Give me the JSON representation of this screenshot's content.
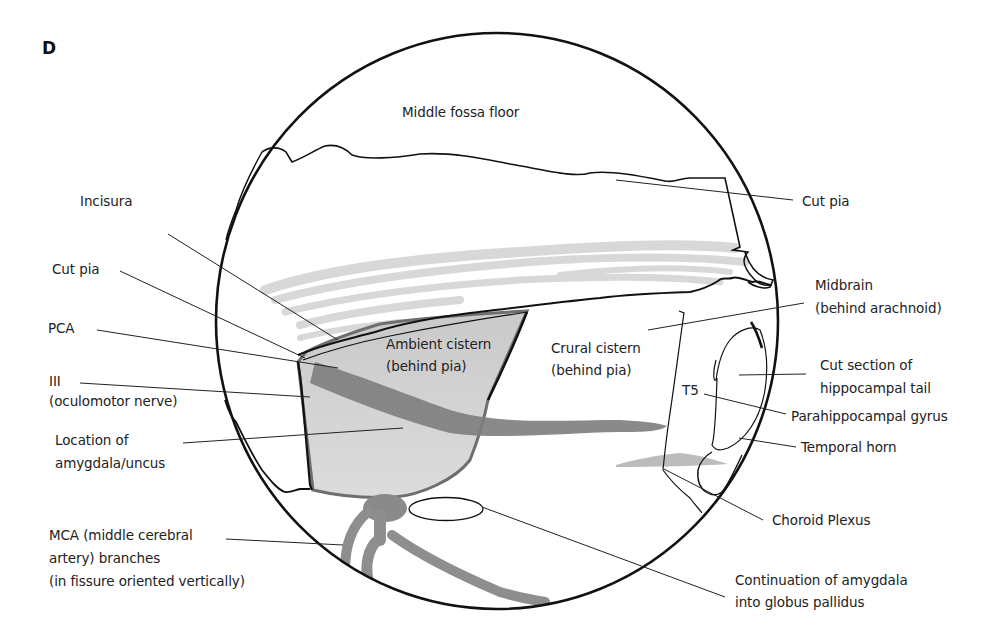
{
  "figure": {
    "panel_letter": "D",
    "colors": {
      "outline": "#111111",
      "leader_line": "#333333",
      "ambient_fill": "#d0d0d0",
      "vessel_dark": "#7a7a7a",
      "vessel_mid": "#8f8f8f",
      "arachnoid_streaks": "#d6d6d6",
      "choroid_plexus": "#bdbdbd"
    }
  },
  "labels": {
    "middle_fossa_floor": "Middle fossa floor",
    "incisura": "Incisura",
    "cut_pia_left": "Cut pia",
    "cut_pia_right": "Cut pia",
    "pca": "PCA",
    "iii_line1": "III",
    "iii_line2": "(oculomotor nerve)",
    "amygdala_line1": "Location of",
    "amygdala_line2": "amygdala/uncus",
    "mca_line1": "MCA (middle cerebral",
    "mca_line2": "artery) branches",
    "mca_line3": "(in fissure oriented vertically)",
    "ambient_line1": "Ambient cistern",
    "ambient_line2": "(behind pia)",
    "crural_line1": "Crural cistern",
    "crural_line2": "(behind pia)",
    "midbrain_line1": "Midbrain",
    "midbrain_line2": "(behind arachnoid)",
    "hippo_line1": "Cut section of",
    "hippo_line2": "hippocampal tail",
    "t5": "T5",
    "parahippocampal": "Parahippocampal gyrus",
    "temporal_horn": "Temporal horn",
    "choroid_plexus": "Choroid Plexus",
    "globus_line1": "Continuation of amygdala",
    "globus_line2": "into globus pallidus"
  }
}
